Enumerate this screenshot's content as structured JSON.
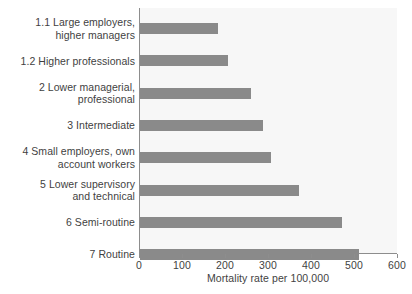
{
  "chart_data": {
    "type": "bar",
    "orientation": "horizontal",
    "title": "",
    "xlabel": "Mortality rate per 100,000",
    "ylabel": "",
    "xlim": [
      0,
      600
    ],
    "xticks": [
      0,
      100,
      200,
      300,
      400,
      500,
      600
    ],
    "xtick_labels": [
      "0",
      "100",
      "200",
      "300",
      "400",
      "500",
      "600"
    ],
    "grid": false,
    "legend": "none",
    "bar_color": "#8a8a8a",
    "plot_background": "#f7f7f7",
    "text_color": "#3f3f3f",
    "axis_color": "#8d8d8d",
    "categories": [
      "1.1 Large employers, higher managers",
      "1.2 Higher professionals",
      "2 Lower managerial, professional",
      "3 Intermediate",
      "4 Small employers, own account workers",
      "5 Lower supervisory and technical",
      "6 Semi-routine",
      "7 Routine"
    ],
    "values": [
      182,
      205,
      258,
      285,
      305,
      370,
      470,
      510
    ],
    "category_lines": [
      [
        "1.1 Large employers,",
        "higher managers"
      ],
      [
        "1.2 Higher professionals"
      ],
      [
        "2 Lower managerial,",
        "professional"
      ],
      [
        "3 Intermediate"
      ],
      [
        "4 Small employers, own",
        "account workers"
      ],
      [
        "5 Lower supervisory",
        "and technical"
      ],
      [
        "6 Semi-routine"
      ],
      [
        "7 Routine"
      ]
    ]
  }
}
